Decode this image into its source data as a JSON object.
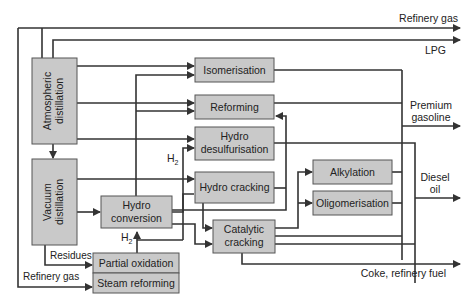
{
  "diagram": {
    "units": {
      "atmospheric_distillation": {
        "line1": "Atmospheric",
        "line2": "distillation"
      },
      "vacuum_distillation": {
        "line1": "Vacuum",
        "line2": "distillation"
      },
      "isomerisation": "Isomerisation",
      "reforming": "Reforming",
      "hydro_desulfurisation": {
        "line1": "Hydro",
        "line2": "desulfurisation"
      },
      "hydro_cracking": "Hydro cracking",
      "hydro_conversion": {
        "line1": "Hydro",
        "line2": "conversion"
      },
      "catalytic_cracking": {
        "line1": "Catalytic",
        "line2": "cracking"
      },
      "alkylation": "Alkylation",
      "oligomerisation": "Oligomerisation",
      "partial_oxidation": "Partial oxidation",
      "steam_reforming": "Steam reforming"
    },
    "products": {
      "refinery_gas": "Refinery gas",
      "lpg": "LPG",
      "premium_gasoline": {
        "line1": "Premium",
        "line2": "gasoline"
      },
      "diesel_oil": {
        "line1": "Diesel",
        "line2": "oil"
      },
      "coke_refinery_fuel": "Coke, refinery fuel"
    },
    "stream_labels": {
      "h2_upper": "H",
      "h2_upper_sub": "2",
      "h2_lower": "H",
      "h2_lower_sub": "2",
      "residues": "Residues",
      "refinery_gas_in": "Refinery gas"
    },
    "colors": {
      "box_fill": "#c9c9c9",
      "box_stroke": "#555555",
      "line": "#333333",
      "text": "#222222"
    }
  }
}
